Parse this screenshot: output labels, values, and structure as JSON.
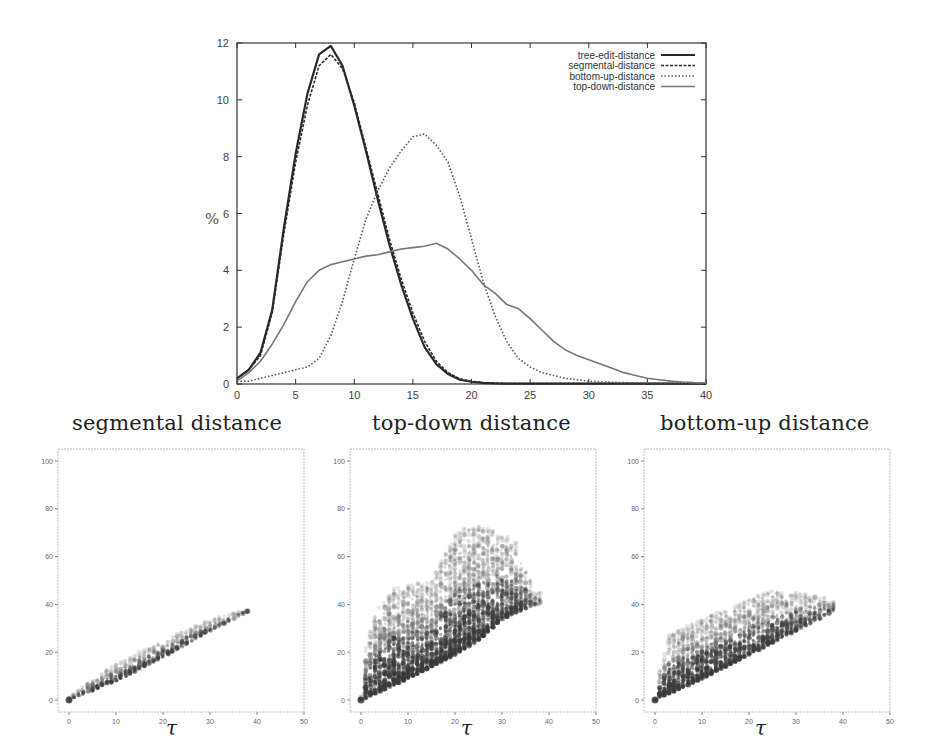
{
  "chart_data": [
    {
      "type": "line",
      "title": "",
      "xlabel": "",
      "ylabel": "%",
      "xlim": [
        0,
        40
      ],
      "ylim": [
        0,
        12
      ],
      "xticks": [
        0,
        5,
        10,
        15,
        20,
        25,
        30,
        35,
        40
      ],
      "yticks": [
        0,
        2,
        4,
        6,
        8,
        10,
        12
      ],
      "grid": false,
      "legend_position": "upper right",
      "x": [
        0,
        1,
        2,
        3,
        4,
        5,
        6,
        7,
        8,
        9,
        10,
        11,
        12,
        13,
        14,
        15,
        16,
        17,
        18,
        19,
        20,
        21,
        22,
        23,
        24,
        25,
        26,
        27,
        28,
        29,
        30,
        31,
        32,
        33,
        34,
        35,
        36,
        37,
        38,
        39,
        40
      ],
      "series": [
        {
          "name": "tree-edit-distance",
          "style": "solid-thick",
          "values": [
            0.2,
            0.5,
            1.1,
            2.6,
            5.5,
            8.1,
            10.2,
            11.6,
            11.9,
            11.2,
            9.8,
            8.2,
            6.5,
            4.9,
            3.5,
            2.3,
            1.3,
            0.7,
            0.35,
            0.15,
            0.08,
            0.04,
            0.02,
            0.01,
            0.01,
            0.01,
            0.01,
            0.01,
            0.01,
            0.01,
            0.01,
            0.01,
            0.01,
            0.01,
            0.01,
            0.01,
            0.01,
            0.01,
            0.01,
            0.01,
            0.01
          ]
        },
        {
          "name": "segmental-distance",
          "style": "dashed",
          "values": [
            0.2,
            0.5,
            1.0,
            2.5,
            5.3,
            7.8,
            9.8,
            11.2,
            11.6,
            11.1,
            9.9,
            8.3,
            6.7,
            5.1,
            3.7,
            2.5,
            1.5,
            0.8,
            0.4,
            0.18,
            0.09,
            0.05,
            0.03,
            0.02,
            0.02,
            0.02,
            0.02,
            0.02,
            0.02,
            0.02,
            0.02,
            0.02,
            0.02,
            0.02,
            0.02,
            0.02,
            0.02,
            0.02,
            0.02,
            0.02,
            0.02
          ]
        },
        {
          "name": "bottom-up-distance",
          "style": "dotted",
          "values": [
            0.1,
            0.1,
            0.2,
            0.3,
            0.4,
            0.5,
            0.6,
            0.9,
            1.7,
            2.9,
            4.4,
            5.8,
            6.8,
            7.6,
            8.2,
            8.7,
            8.8,
            8.4,
            7.8,
            6.6,
            5.1,
            3.6,
            2.4,
            1.5,
            0.9,
            0.6,
            0.4,
            0.3,
            0.2,
            0.15,
            0.1,
            0.08,
            0.06,
            0.05,
            0.04,
            0.03,
            0.03,
            0.02,
            0.02,
            0.02,
            0.02
          ]
        },
        {
          "name": "top-down-distance",
          "style": "fine-dotted-solid",
          "values": [
            0.1,
            0.4,
            0.8,
            1.4,
            2.1,
            2.9,
            3.6,
            4.0,
            4.2,
            4.3,
            4.4,
            4.5,
            4.55,
            4.65,
            4.75,
            4.8,
            4.85,
            4.95,
            4.75,
            4.4,
            4.0,
            3.5,
            3.2,
            2.8,
            2.65,
            2.3,
            1.9,
            1.5,
            1.2,
            1.0,
            0.85,
            0.7,
            0.55,
            0.4,
            0.3,
            0.2,
            0.15,
            0.1,
            0.07,
            0.05,
            0.04
          ]
        }
      ]
    },
    {
      "type": "scatter",
      "title": "segmental distance",
      "xlabel": "τ",
      "ylabel": "",
      "xlim": [
        0,
        50
      ],
      "ylim": [
        0,
        100
      ],
      "xticks": [
        0,
        10,
        20,
        30,
        40,
        50
      ],
      "yticks": [
        0,
        20,
        40,
        60,
        80,
        100
      ],
      "grid": false,
      "description": "Narrow band close to the diagonal, from (0,0) up to about (38,38)",
      "band": {
        "x_max": 38,
        "lower": [
          [
            0,
            0
          ],
          [
            10,
            8
          ],
          [
            20,
            18
          ],
          [
            30,
            29
          ],
          [
            38,
            37
          ]
        ],
        "upper": [
          [
            0,
            1
          ],
          [
            5,
            9
          ],
          [
            10,
            15
          ],
          [
            20,
            25
          ],
          [
            30,
            34
          ],
          [
            38,
            38
          ]
        ]
      }
    },
    {
      "type": "scatter",
      "title": "top-down distance",
      "xlabel": "τ",
      "ylabel": "",
      "xlim": [
        0,
        50
      ],
      "ylim": [
        0,
        100
      ],
      "xticks": [
        0,
        10,
        20,
        30,
        40,
        50
      ],
      "yticks": [
        0,
        20,
        40,
        60,
        80,
        100
      ],
      "grid": false,
      "description": "Wide cloud: lower bound ≈ τ, upper bound climbing to ~70 near τ≈23-25, outliers up to ~98",
      "band": {
        "x_max": 38,
        "lower": [
          [
            0,
            0
          ],
          [
            10,
            9
          ],
          [
            20,
            19
          ],
          [
            25,
            25
          ],
          [
            30,
            34
          ],
          [
            37,
            40
          ]
        ],
        "upper": [
          [
            0,
            2
          ],
          [
            1,
            22
          ],
          [
            3,
            36
          ],
          [
            7,
            47
          ],
          [
            15,
            50
          ],
          [
            20,
            70
          ],
          [
            23,
            73
          ],
          [
            27,
            72
          ],
          [
            33,
            66
          ],
          [
            37,
            45
          ]
        ]
      }
    },
    {
      "type": "scatter",
      "title": "bottom-up distance",
      "xlabel": "τ",
      "ylabel": "",
      "xlim": [
        0,
        50
      ],
      "ylim": [
        0,
        100
      ],
      "xticks": [
        0,
        10,
        20,
        30,
        40,
        50
      ],
      "yticks": [
        0,
        20,
        40,
        60,
        80,
        100
      ],
      "grid": false,
      "description": "Cloud: lower bound ≈ τ, upper bound up to ~45-50, concentrated between 10-40",
      "band": {
        "x_max": 38,
        "lower": [
          [
            0,
            0
          ],
          [
            10,
            9
          ],
          [
            20,
            19
          ],
          [
            30,
            29
          ],
          [
            38,
            37
          ]
        ],
        "upper": [
          [
            0,
            2
          ],
          [
            1,
            13
          ],
          [
            3,
            27
          ],
          [
            6,
            31
          ],
          [
            15,
            38
          ],
          [
            25,
            46
          ],
          [
            30,
            45
          ],
          [
            36,
            43
          ]
        ]
      }
    }
  ],
  "legend": {
    "entries": [
      "tree-edit-distance",
      "segmental-distance",
      "bottom-up-distance",
      "top-down-distance"
    ]
  },
  "top_chart": {
    "ylabel": "%",
    "xtick_labels": [
      "0",
      "5",
      "10",
      "15",
      "20",
      "25",
      "30",
      "35",
      "40"
    ],
    "ytick_labels": [
      "0",
      "2",
      "4",
      "6",
      "8",
      "10",
      "12"
    ]
  },
  "scatter_plots": [
    {
      "title": "segmental distance",
      "xlabel": "τ",
      "xtick_labels": [
        "0",
        "10",
        "20",
        "30",
        "40",
        "50"
      ],
      "ytick_labels": [
        "0",
        "20",
        "40",
        "60",
        "80",
        "100"
      ]
    },
    {
      "title": "top-down distance",
      "xlabel": "τ",
      "xtick_labels": [
        "0",
        "10",
        "20",
        "30",
        "40",
        "50"
      ],
      "ytick_labels": [
        "0",
        "20",
        "40",
        "60",
        "80",
        "100"
      ]
    },
    {
      "title": "bottom-up distance",
      "xlabel": "τ",
      "xtick_labels": [
        "0",
        "10",
        "20",
        "30",
        "40",
        "50"
      ],
      "ytick_labels": [
        "0",
        "20",
        "40",
        "60",
        "80",
        "100"
      ]
    }
  ],
  "colors": {
    "axis": "#333333",
    "line_dark": "#2a2a2a",
    "line_mid": "#555555",
    "line_light": "#777777",
    "scatter_dark": "#3a3a3a",
    "scatter_mid": "#707070",
    "frame_light": "#bdbdbd"
  }
}
